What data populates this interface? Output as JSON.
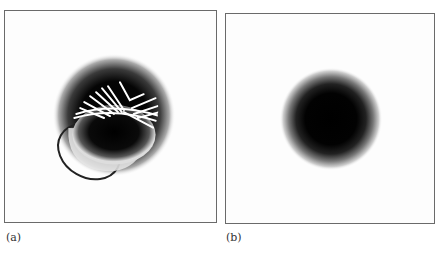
{
  "figure": {
    "panels": [
      {
        "id": "a",
        "label": "(a)",
        "content": "dark blob with white streamlines on upper half and an offset elliptical ring below-left"
      },
      {
        "id": "b",
        "label": "(b)",
        "content": "smooth circular dark blob with gaussian falloff"
      }
    ],
    "colors": {
      "frame": "#6a6a6a",
      "blob_core": "#000000",
      "background": "#ffffff",
      "streak": "#ffffff",
      "ring": "#222222"
    }
  }
}
